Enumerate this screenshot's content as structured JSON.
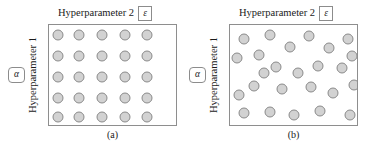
{
  "figure": {
    "background_color": "#ffffff",
    "box_border_color": "#8e8e8e",
    "dot_fill_color": "#d2d2d2",
    "dot_border_color": "#8a8a8a"
  },
  "panels": [
    {
      "id": "panel-a",
      "caption": "(a)",
      "layout_type": "grid",
      "top_axis_label": "Hyperparameter 2",
      "top_axis_symbol": "ε",
      "left_axis_label": "Hyperparameter 1",
      "left_axis_symbol": "α",
      "point_count": 25,
      "points": [
        {
          "x": 9,
          "y": 10
        },
        {
          "x": 30,
          "y": 10
        },
        {
          "x": 53,
          "y": 10
        },
        {
          "x": 76,
          "y": 10
        },
        {
          "x": 98,
          "y": 10
        },
        {
          "x": 9,
          "y": 31
        },
        {
          "x": 30,
          "y": 31
        },
        {
          "x": 53,
          "y": 31
        },
        {
          "x": 76,
          "y": 31
        },
        {
          "x": 98,
          "y": 31
        },
        {
          "x": 9,
          "y": 52
        },
        {
          "x": 30,
          "y": 52
        },
        {
          "x": 53,
          "y": 52
        },
        {
          "x": 76,
          "y": 52
        },
        {
          "x": 98,
          "y": 52
        },
        {
          "x": 9,
          "y": 73
        },
        {
          "x": 30,
          "y": 73
        },
        {
          "x": 53,
          "y": 73
        },
        {
          "x": 76,
          "y": 73
        },
        {
          "x": 98,
          "y": 73
        },
        {
          "x": 9,
          "y": 92
        },
        {
          "x": 30,
          "y": 92
        },
        {
          "x": 53,
          "y": 92
        },
        {
          "x": 76,
          "y": 92
        },
        {
          "x": 98,
          "y": 92
        }
      ]
    },
    {
      "id": "panel-b",
      "caption": "(b)",
      "layout_type": "random",
      "top_axis_label": "Hyperparameter 2",
      "top_axis_symbol": "ε",
      "left_axis_label": "Hyperparameter 1",
      "left_axis_symbol": "α",
      "point_count": 25,
      "points": [
        {
          "x": 14,
          "y": 14
        },
        {
          "x": 40,
          "y": 10
        },
        {
          "x": 79,
          "y": 11
        },
        {
          "x": 118,
          "y": 14
        },
        {
          "x": 60,
          "y": 22
        },
        {
          "x": 29,
          "y": 30
        },
        {
          "x": 99,
          "y": 23
        },
        {
          "x": 7,
          "y": 33
        },
        {
          "x": 122,
          "y": 31
        },
        {
          "x": 46,
          "y": 42
        },
        {
          "x": 68,
          "y": 48
        },
        {
          "x": 88,
          "y": 41
        },
        {
          "x": 112,
          "y": 43
        },
        {
          "x": 24,
          "y": 61
        },
        {
          "x": 52,
          "y": 64
        },
        {
          "x": 81,
          "y": 62
        },
        {
          "x": 103,
          "y": 68
        },
        {
          "x": 124,
          "y": 60
        },
        {
          "x": 9,
          "y": 70
        },
        {
          "x": 14,
          "y": 88
        },
        {
          "x": 40,
          "y": 87
        },
        {
          "x": 64,
          "y": 90
        },
        {
          "x": 90,
          "y": 86
        },
        {
          "x": 120,
          "y": 90
        },
        {
          "x": 34,
          "y": 48
        }
      ]
    }
  ]
}
